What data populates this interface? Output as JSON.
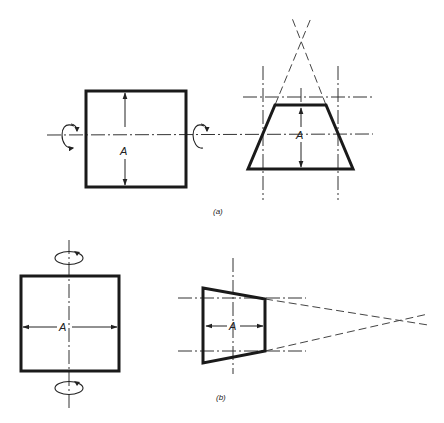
{
  "figure": {
    "colors": {
      "line": "#1a1a1a",
      "background": "#ffffff"
    },
    "panels": [
      {
        "id": "a",
        "caption": "(a)",
        "caption_letter": "a",
        "rotation_axis": "horizontal",
        "square": {
          "dimension_label": "A",
          "dimension_orientation": "vertical"
        },
        "trapezoid": {
          "dimension_label": "A",
          "dimension_orientation": "vertical",
          "converges": "up"
        },
        "icons": [
          "rotation-arrow-icon",
          "rotation-arrow-icon"
        ]
      },
      {
        "id": "b",
        "caption": "(b)",
        "caption_letter": "b",
        "rotation_axis": "vertical",
        "square": {
          "dimension_label": "A",
          "dimension_orientation": "horizontal"
        },
        "trapezoid": {
          "dimension_label": "A",
          "dimension_orientation": "horizontal",
          "converges": "right"
        },
        "icons": [
          "rotation-arrow-icon",
          "rotation-arrow-icon"
        ]
      }
    ]
  }
}
